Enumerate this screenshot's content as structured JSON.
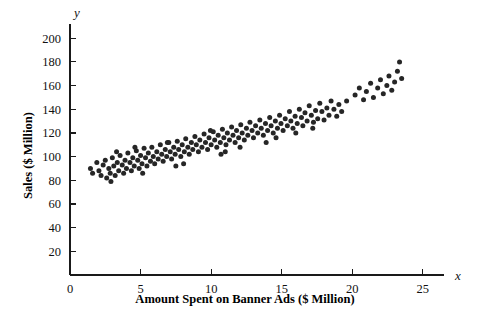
{
  "chart_data": {
    "type": "scatter",
    "title": "",
    "xlabel": "Amount Spent on Banner Ads ($ Million)",
    "ylabel": "Sales ($ Million)",
    "x_axis_name": "x",
    "y_axis_name": "y",
    "xlim": [
      0,
      26.5
    ],
    "ylim": [
      0,
      212
    ],
    "xticks": [
      0,
      5,
      10,
      15,
      20,
      25
    ],
    "yticks": [
      20,
      40,
      60,
      80,
      100,
      120,
      140,
      160,
      180,
      200
    ],
    "xtick_labels": [
      "0",
      "5",
      "10",
      "15",
      "20",
      "25"
    ],
    "ytick_labels": [
      "20",
      "40",
      "60",
      "80",
      "100",
      "120",
      "140",
      "160",
      "180",
      "200"
    ],
    "grid": false,
    "legend": null,
    "marker_color": "#262626",
    "marker_size": 5,
    "points": [
      [
        1.45,
        90
      ],
      [
        1.6,
        86
      ],
      [
        1.9,
        95
      ],
      [
        2.05,
        88
      ],
      [
        2.2,
        84
      ],
      [
        2.35,
        93
      ],
      [
        2.5,
        97
      ],
      [
        2.6,
        82
      ],
      [
        2.75,
        90
      ],
      [
        2.85,
        86
      ],
      [
        3.0,
        99
      ],
      [
        3.1,
        92
      ],
      [
        3.2,
        84
      ],
      [
        3.35,
        95
      ],
      [
        3.45,
        88
      ],
      [
        3.55,
        101
      ],
      [
        3.7,
        93
      ],
      [
        3.8,
        86
      ],
      [
        3.9,
        97
      ],
      [
        4.0,
        90
      ],
      [
        4.1,
        103
      ],
      [
        4.25,
        95
      ],
      [
        4.35,
        88
      ],
      [
        4.45,
        99
      ],
      [
        4.55,
        92
      ],
      [
        4.7,
        105
      ],
      [
        4.8,
        97
      ],
      [
        4.9,
        90
      ],
      [
        5.0,
        101
      ],
      [
        5.1,
        94
      ],
      [
        5.25,
        107
      ],
      [
        5.35,
        99
      ],
      [
        5.45,
        92
      ],
      [
        5.55,
        103
      ],
      [
        5.7,
        96
      ],
      [
        5.8,
        108
      ],
      [
        5.9,
        100
      ],
      [
        6.0,
        94
      ],
      [
        6.15,
        104
      ],
      [
        6.25,
        98
      ],
      [
        6.4,
        110
      ],
      [
        6.5,
        102
      ],
      [
        6.6,
        96
      ],
      [
        6.75,
        106
      ],
      [
        6.85,
        100
      ],
      [
        7.0,
        112
      ],
      [
        7.1,
        104
      ],
      [
        7.2,
        98
      ],
      [
        7.35,
        108
      ],
      [
        7.45,
        102
      ],
      [
        7.6,
        113
      ],
      [
        7.7,
        106
      ],
      [
        7.85,
        100
      ],
      [
        7.95,
        110
      ],
      [
        8.1,
        104
      ],
      [
        8.2,
        115
      ],
      [
        8.35,
        108
      ],
      [
        8.45,
        102
      ],
      [
        8.6,
        112
      ],
      [
        8.7,
        106
      ],
      [
        8.85,
        117
      ],
      [
        8.95,
        110
      ],
      [
        9.1,
        104
      ],
      [
        9.2,
        114
      ],
      [
        9.35,
        108
      ],
      [
        9.5,
        119
      ],
      [
        9.6,
        112
      ],
      [
        9.75,
        106
      ],
      [
        9.85,
        116
      ],
      [
        10.0,
        110
      ],
      [
        10.15,
        121
      ],
      [
        10.25,
        114
      ],
      [
        10.4,
        108
      ],
      [
        10.5,
        118
      ],
      [
        10.65,
        112
      ],
      [
        10.8,
        123
      ],
      [
        10.9,
        116
      ],
      [
        11.05,
        110
      ],
      [
        11.15,
        120
      ],
      [
        11.3,
        114
      ],
      [
        11.45,
        125
      ],
      [
        11.55,
        118
      ],
      [
        11.7,
        112
      ],
      [
        11.8,
        122
      ],
      [
        11.95,
        116
      ],
      [
        12.1,
        127
      ],
      [
        12.2,
        120
      ],
      [
        12.35,
        114
      ],
      [
        12.5,
        124
      ],
      [
        12.6,
        118
      ],
      [
        12.75,
        129
      ],
      [
        12.9,
        122
      ],
      [
        13.0,
        116
      ],
      [
        13.15,
        126
      ],
      [
        13.3,
        120
      ],
      [
        13.45,
        131
      ],
      [
        13.55,
        124
      ],
      [
        13.7,
        118
      ],
      [
        13.85,
        128
      ],
      [
        14.0,
        122
      ],
      [
        14.15,
        133
      ],
      [
        14.25,
        126
      ],
      [
        14.4,
        120
      ],
      [
        14.55,
        130
      ],
      [
        14.7,
        124
      ],
      [
        14.85,
        135
      ],
      [
        14.95,
        128
      ],
      [
        15.1,
        122
      ],
      [
        15.25,
        132
      ],
      [
        15.4,
        126
      ],
      [
        15.55,
        138
      ],
      [
        15.65,
        130
      ],
      [
        15.8,
        124
      ],
      [
        15.95,
        134
      ],
      [
        16.1,
        128
      ],
      [
        16.25,
        140
      ],
      [
        16.4,
        133
      ],
      [
        16.5,
        126
      ],
      [
        16.65,
        137
      ],
      [
        16.8,
        130
      ],
      [
        16.95,
        143
      ],
      [
        17.1,
        135
      ],
      [
        17.25,
        129
      ],
      [
        17.4,
        139
      ],
      [
        17.55,
        132
      ],
      [
        17.7,
        145
      ],
      [
        17.85,
        138
      ],
      [
        18.0,
        131
      ],
      [
        18.2,
        141
      ],
      [
        18.35,
        135
      ],
      [
        18.5,
        147
      ],
      [
        18.7,
        140
      ],
      [
        18.9,
        134
      ],
      [
        19.05,
        144
      ],
      [
        19.25,
        138
      ],
      [
        20.2,
        152
      ],
      [
        20.5,
        158
      ],
      [
        20.8,
        148
      ],
      [
        21.0,
        155
      ],
      [
        21.3,
        162
      ],
      [
        21.5,
        150
      ],
      [
        21.8,
        158
      ],
      [
        22.0,
        165
      ],
      [
        22.2,
        153
      ],
      [
        22.45,
        160
      ],
      [
        22.6,
        168
      ],
      [
        22.8,
        156
      ],
      [
        23.0,
        163
      ],
      [
        23.2,
        172
      ],
      [
        23.35,
        180
      ],
      [
        23.5,
        166
      ],
      [
        19.6,
        147
      ],
      [
        12.05,
        108
      ],
      [
        9.95,
        122
      ],
      [
        6.9,
        112
      ],
      [
        4.6,
        108
      ],
      [
        3.3,
        104
      ],
      [
        8.05,
        94
      ],
      [
        10.7,
        102
      ],
      [
        13.9,
        112
      ],
      [
        16.0,
        120
      ],
      [
        2.9,
        79
      ],
      [
        5.15,
        86
      ],
      [
        7.5,
        92
      ],
      [
        11.0,
        104
      ],
      [
        14.6,
        116
      ],
      [
        17.2,
        124
      ]
    ]
  }
}
